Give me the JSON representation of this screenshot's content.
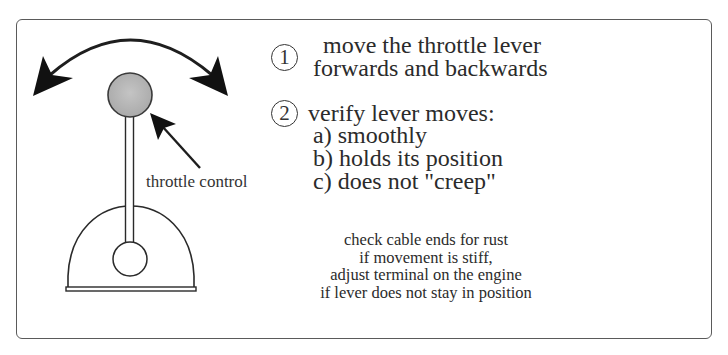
{
  "diagram": {
    "callout_label": "throttle control",
    "icons": {
      "motion": "double-headed-curved-arrow-icon",
      "pointer": "pointer-arrow-icon"
    },
    "colors": {
      "knob_fill": "#b3b3b3",
      "line": "#2a2a2a",
      "frame": "#5a5a5a"
    }
  },
  "steps": [
    {
      "number": "1",
      "lines": [
        "move the throttle lever",
        "forwards and backwards"
      ]
    },
    {
      "number": "2",
      "title": "verify lever moves:",
      "checks": [
        "a) smoothly",
        "b) holds its position",
        "c) does not \"creep\""
      ]
    }
  ],
  "notes": [
    "check cable ends for rust",
    "if movement is stiff,",
    "adjust terminal on the engine",
    "if lever does not stay in position"
  ]
}
